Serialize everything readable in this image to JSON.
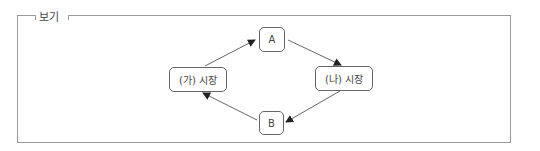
{
  "box": {
    "title": "보기"
  },
  "diagram": {
    "nodes": {
      "a": "A",
      "b": "B",
      "market_ga": "(가) 시장",
      "market_na": "(나) 시장"
    },
    "edges": [
      {
        "from": "(가) 시장",
        "to": "A"
      },
      {
        "from": "A",
        "to": "(나) 시장"
      },
      {
        "from": "(나) 시장",
        "to": "B"
      },
      {
        "from": "B",
        "to": "(가) 시장"
      }
    ]
  }
}
